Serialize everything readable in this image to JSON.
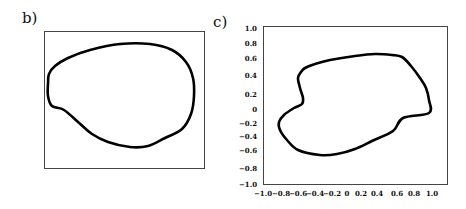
{
  "panels": {
    "b": {
      "label": "b)",
      "box": {
        "x": 44,
        "y": 31,
        "w": 160,
        "h": 137
      },
      "curve_points": [
        [
          49,
          74
        ],
        [
          55,
          66
        ],
        [
          68,
          58
        ],
        [
          90,
          50
        ],
        [
          120,
          44
        ],
        [
          150,
          44
        ],
        [
          172,
          50
        ],
        [
          186,
          62
        ],
        [
          193,
          78
        ],
        [
          194,
          96
        ],
        [
          191,
          114
        ],
        [
          182,
          129
        ],
        [
          165,
          138
        ],
        [
          148,
          146
        ],
        [
          130,
          147
        ],
        [
          108,
          142
        ],
        [
          92,
          134
        ],
        [
          78,
          122
        ],
        [
          64,
          110
        ],
        [
          52,
          106
        ],
        [
          48,
          96
        ],
        [
          48,
          84
        ],
        [
          49,
          74
        ]
      ]
    },
    "c": {
      "label": "c)",
      "box": {
        "x": 263,
        "y": 26,
        "w": 184,
        "h": 158
      },
      "curve_points": [
        [
          301,
          72
        ],
        [
          298,
          78
        ],
        [
          300,
          88
        ],
        [
          303,
          98
        ],
        [
          302,
          104
        ],
        [
          294,
          108
        ],
        [
          284,
          115
        ],
        [
          279,
          122
        ],
        [
          280,
          130
        ],
        [
          287,
          140
        ],
        [
          298,
          150
        ],
        [
          320,
          155
        ],
        [
          337,
          154
        ],
        [
          355,
          149
        ],
        [
          372,
          141
        ],
        [
          393,
          131
        ],
        [
          403,
          118
        ],
        [
          429,
          113
        ],
        [
          429,
          100
        ],
        [
          426,
          88
        ],
        [
          420,
          78
        ],
        [
          411,
          66
        ],
        [
          402,
          57
        ],
        [
          392,
          55
        ],
        [
          375,
          54
        ],
        [
          355,
          56
        ],
        [
          330,
          60
        ],
        [
          315,
          64
        ],
        [
          305,
          68
        ],
        [
          301,
          72
        ]
      ]
    }
  },
  "chart_data": {
    "type": "line",
    "title": "",
    "panels": [
      {
        "id": "b",
        "label": "b)",
        "description": "Closed smooth egg-shaped contour inside an unlabeled rectangular frame",
        "axes": "none"
      },
      {
        "id": "c",
        "label": "c)",
        "description": "Closed contour with a concave notch on the left side",
        "xlim": [
          -1.0,
          1.0
        ],
        "ylim": [
          -1.0,
          1.0
        ],
        "xticks": [
          "-1.0",
          "-0.8",
          "-0.6",
          "-0.4",
          "-0.2",
          "0",
          "0.2",
          "0.4",
          "0.6",
          "0.8",
          "1.0"
        ],
        "yticks": [
          "1.0",
          "0.8",
          "0.6",
          "0.4",
          "0.2",
          "0",
          "-0.2",
          "-0.4",
          "-0.6",
          "-0.8",
          "-1.0"
        ],
        "approx_contour": [
          {
            "x": -0.6,
            "y": 0.45
          },
          {
            "x": -0.65,
            "y": 0.35
          },
          {
            "x": -0.6,
            "y": 0.15
          },
          {
            "x": -0.62,
            "y": 0.05
          },
          {
            "x": -0.75,
            "y": -0.05
          },
          {
            "x": -0.85,
            "y": -0.2
          },
          {
            "x": -0.82,
            "y": -0.35
          },
          {
            "x": -0.7,
            "y": -0.55
          },
          {
            "x": -0.4,
            "y": -0.65
          },
          {
            "x": -0.1,
            "y": -0.6
          },
          {
            "x": 0.2,
            "y": -0.5
          },
          {
            "x": 0.5,
            "y": -0.35
          },
          {
            "x": 0.78,
            "y": -0.1
          },
          {
            "x": 0.78,
            "y": 0.15
          },
          {
            "x": 0.7,
            "y": 0.35
          },
          {
            "x": 0.5,
            "y": 0.58
          },
          {
            "x": 0.3,
            "y": 0.62
          },
          {
            "x": 0.0,
            "y": 0.6
          },
          {
            "x": -0.3,
            "y": 0.55
          },
          {
            "x": -0.6,
            "y": 0.45
          }
        ],
        "grid": false
      }
    ]
  },
  "axes_c": {
    "yticks": [
      {
        "label": "1.0",
        "y": 28
      },
      {
        "label": "0.8",
        "y": 43
      },
      {
        "label": "0.6",
        "y": 58
      },
      {
        "label": "0.4",
        "y": 75
      },
      {
        "label": "0.2",
        "y": 94
      },
      {
        "label": "0",
        "y": 109
      },
      {
        "label": "−0.2",
        "y": 123
      },
      {
        "label": "−0.4",
        "y": 136
      },
      {
        "label": "−0.6",
        "y": 150
      },
      {
        "label": "−0.8",
        "y": 168
      },
      {
        "label": "−1.0",
        "y": 184
      }
    ],
    "xticks": [
      {
        "label": "−1.0",
        "x": 263
      },
      {
        "label": "−0.8",
        "x": 281
      },
      {
        "label": "−0.6",
        "x": 298
      },
      {
        "label": "−0.4",
        "x": 315
      },
      {
        "label": "−0.2",
        "x": 332
      },
      {
        "label": "0",
        "x": 347
      },
      {
        "label": "0.2",
        "x": 361
      },
      {
        "label": "0.4",
        "x": 377
      },
      {
        "label": "0.6",
        "x": 397
      },
      {
        "label": "0.8",
        "x": 414
      },
      {
        "label": "1.0",
        "x": 432
      }
    ]
  }
}
